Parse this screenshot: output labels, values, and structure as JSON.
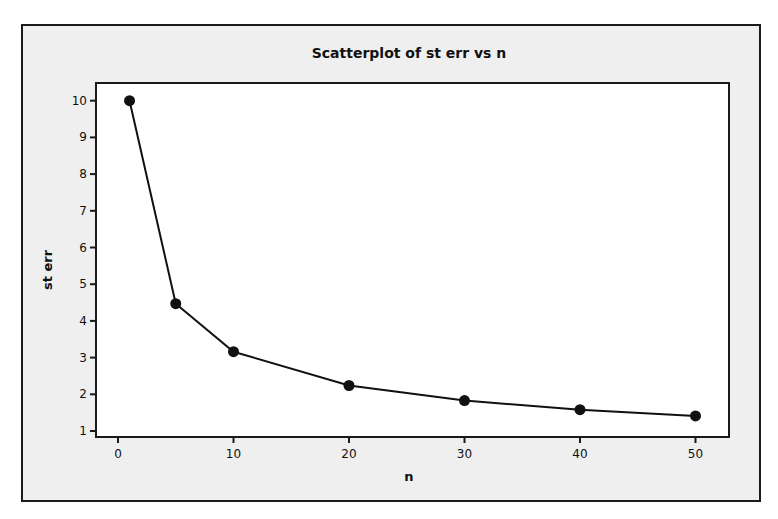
{
  "chart_data": {
    "type": "scatter",
    "title": "Scatterplot of st err vs n",
    "xlabel": "n",
    "ylabel": "st err",
    "x": [
      1,
      5,
      10,
      20,
      30,
      40,
      50
    ],
    "y": [
      10.0,
      4.47,
      3.16,
      2.24,
      1.83,
      1.58,
      1.41
    ],
    "connected_line": true,
    "x_ticks": [
      0,
      10,
      20,
      30,
      40,
      50
    ],
    "y_ticks": [
      1,
      2,
      3,
      4,
      5,
      6,
      7,
      8,
      9,
      10
    ],
    "xlim": [
      -2,
      53
    ],
    "ylim": [
      0.85,
      10.5
    ],
    "grid": false,
    "legend": null,
    "colors": {
      "marker": "#111111",
      "line": "#111111",
      "frame_bg": "#efefef",
      "plot_bg": "#ffffff"
    }
  }
}
